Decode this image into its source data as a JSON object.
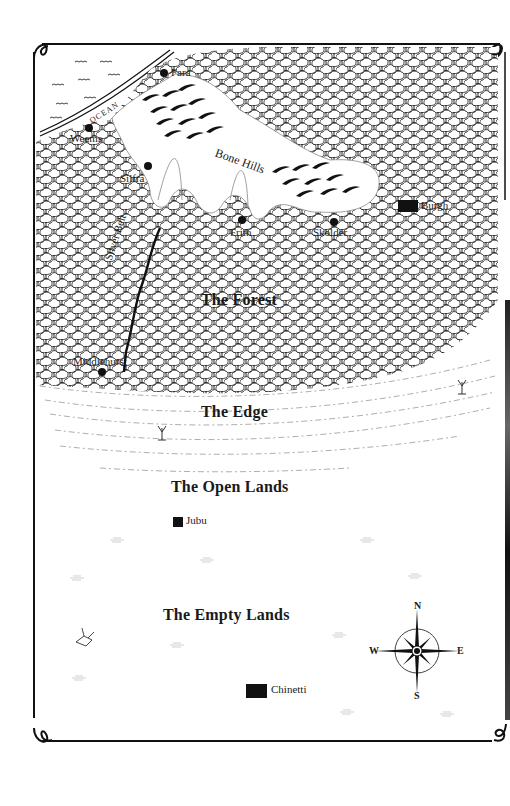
{
  "map": {
    "title": "",
    "regions": [
      {
        "id": "ocean",
        "label": "OCEAN"
      },
      {
        "id": "bone-hills",
        "label": "Bone Hills"
      },
      {
        "id": "silver-belt",
        "label": "Silver Belt"
      },
      {
        "id": "forest",
        "label": "The Forest"
      },
      {
        "id": "edge",
        "label": "The Edge"
      },
      {
        "id": "open-lands",
        "label": "The Open Lands"
      },
      {
        "id": "empty-lands",
        "label": "The Empty Lands"
      }
    ],
    "settlements": [
      {
        "id": "fara",
        "label": "Fara",
        "marker": "dot"
      },
      {
        "id": "weems",
        "label": "Weems",
        "marker": "dot"
      },
      {
        "id": "silfra",
        "label": "Silfra",
        "marker": "dot"
      },
      {
        "id": "frith",
        "label": "Frith",
        "marker": "dot"
      },
      {
        "id": "skolder",
        "label": "Skolder",
        "marker": "dot"
      },
      {
        "id": "burgh",
        "label": "Burgh",
        "marker": "castle"
      },
      {
        "id": "middlehurst",
        "label": "Middlehurst",
        "marker": "dot"
      },
      {
        "id": "jubu",
        "label": "Jubu",
        "marker": "square"
      },
      {
        "id": "chinetti",
        "label": "Chinetti",
        "marker": "castle"
      }
    ],
    "compass": {
      "n": "N",
      "s": "S",
      "e": "E",
      "w": "W"
    },
    "colors": {
      "ink": "#111111",
      "paper": "#ffffff",
      "grass": "#9a9a9a"
    }
  }
}
